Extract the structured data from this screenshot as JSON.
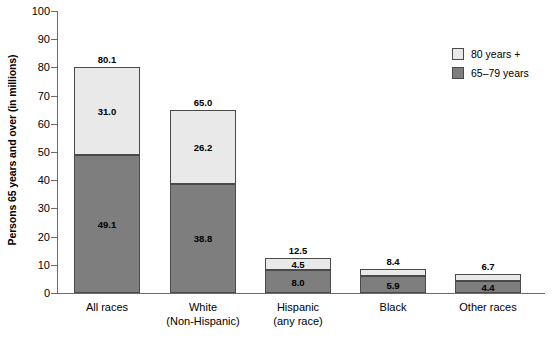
{
  "chart_data": {
    "type": "bar",
    "subtype": "stacked-bar",
    "title": "",
    "xlabel": "",
    "ylabel": "Persons 65 years and over (in millions)",
    "ylim": [
      0,
      100
    ],
    "yticks": [
      0,
      10,
      20,
      30,
      40,
      50,
      60,
      70,
      80,
      90,
      100
    ],
    "ytick_labels": [
      "0",
      "10",
      "20",
      "30",
      "40",
      "50",
      "60",
      "70",
      "80",
      "90",
      "100"
    ],
    "grid": false,
    "legend_position": "top-right",
    "categories": [
      "All races",
      "White\n(Non-Hispanic)",
      "Hispanic\n(any race)",
      "Black",
      "Other races"
    ],
    "category_lines": [
      [
        "All races"
      ],
      [
        "White",
        "(Non-Hispanic)"
      ],
      [
        "Hispanic",
        "(any race)"
      ],
      [
        "Black"
      ],
      [
        "Other races"
      ]
    ],
    "series": [
      {
        "name": "65–79 years",
        "color": "#7e7e7e",
        "values": [
          49.1,
          38.8,
          8.0,
          5.9,
          4.4
        ],
        "labels": [
          "49.1",
          "38.8",
          "8.0",
          "5.9",
          "4.4"
        ]
      },
      {
        "name": "80 years +",
        "color": "#e9e9e9",
        "values": [
          31.0,
          26.2,
          4.5,
          2.5,
          2.3
        ],
        "labels": [
          "31.0",
          "26.2",
          "4.5",
          "",
          ""
        ]
      }
    ],
    "totals": [
      80.1,
      65.0,
      12.5,
      8.4,
      6.7
    ],
    "total_labels": [
      "80.1",
      "65.0",
      "12.5",
      "8.4",
      "6.7"
    ]
  },
  "legend": {
    "items": [
      {
        "label": "80 years +",
        "color": "#e9e9e9"
      },
      {
        "label": "65–79 years",
        "color": "#7e7e7e"
      }
    ]
  },
  "colors": {
    "segment_top": "#e9e9e9",
    "segment_bottom": "#7e7e7e",
    "axis": "#6b6b6b",
    "border": "#4a4a4a",
    "background": "#ffffff",
    "text": "#000000"
  }
}
